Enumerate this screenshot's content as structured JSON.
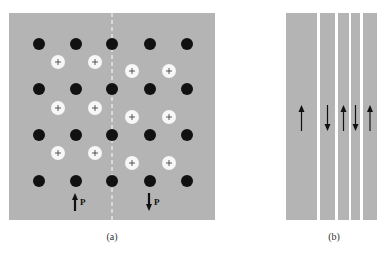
{
  "colors": {
    "panel_bg": "#b4b4b4",
    "anion": "#111111",
    "cation_fill": "#f7f7f7",
    "cation_sign": "#333333",
    "arrow": "#111111",
    "divider": "#ffffff"
  },
  "panel_a": {
    "caption": "(a)",
    "rect": {
      "x": 9,
      "y": 13,
      "w": 206,
      "h": 207
    },
    "domain_wall_x": 112,
    "anions": {
      "radius": 6,
      "xs": [
        39,
        76,
        112,
        150,
        187
      ],
      "ys": [
        44,
        89,
        135,
        181
      ]
    },
    "cations": {
      "radius": 7,
      "sign": "+",
      "left_domain": {
        "xs": [
          58,
          95
        ],
        "ys": [
          62,
          108,
          153
        ]
      },
      "right_domain": {
        "xs": [
          132,
          169
        ],
        "ys": [
          71,
          117,
          163
        ]
      }
    },
    "polarization": [
      {
        "label": "P",
        "direction": "up",
        "x": 75,
        "y1": 193,
        "y2": 211
      },
      {
        "label": "P",
        "direction": "down",
        "x": 149,
        "y1": 193,
        "y2": 211
      }
    ]
  },
  "panel_b": {
    "caption": "(b)",
    "y": 13,
    "h": 207,
    "strips": [
      {
        "x": 286,
        "w": 31,
        "arrow": "up"
      },
      {
        "x": 320,
        "w": 15,
        "arrow": "down"
      },
      {
        "x": 338,
        "w": 11,
        "arrow": "up"
      },
      {
        "x": 351,
        "w": 9,
        "arrow": "down"
      },
      {
        "x": 363,
        "w": 14,
        "arrow": "up"
      }
    ],
    "arrow_y1": 105,
    "arrow_y2": 131
  }
}
